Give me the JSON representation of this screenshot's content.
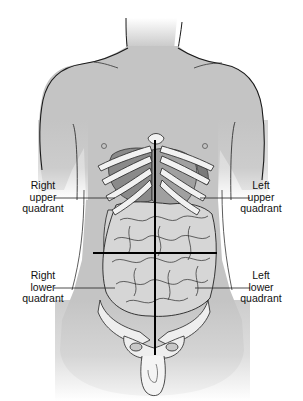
{
  "figure": {
    "colors": {
      "skin": "#c4c4c4",
      "skin_light": "#e2e2e2",
      "outline": "#1a1a1a",
      "bone": "#f2f2f2",
      "organ_dark": "#8a8a8a",
      "organ_mid": "#a5a5a5",
      "intestine": "#d2d2d2",
      "divider_line": "#000000",
      "text": "#111111"
    }
  },
  "labels": {
    "right_upper": {
      "line1": "Right",
      "line2": "upper",
      "line3": "quadrant"
    },
    "left_upper": {
      "line1": "Left",
      "line2": "upper",
      "line3": "quadrant"
    },
    "right_lower": {
      "line1": "Right",
      "line2": "lower",
      "line3": "quadrant"
    },
    "left_lower": {
      "line1": "Left",
      "line2": "lower",
      "line3": "quadrant"
    }
  }
}
